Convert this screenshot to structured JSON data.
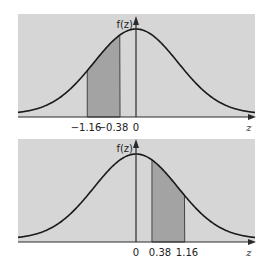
{
  "colors": {
    "background": "#ffffff",
    "panel_fill": "#d6d6d6",
    "shade_fill": "#a3a3a3",
    "curve": "#1a1a1a",
    "axis": "#2a2a2a"
  },
  "chart_data": [
    {
      "type": "area",
      "title": "",
      "ylabel": "f(z)",
      "xlabel": "z",
      "distribution": "standard normal",
      "shaded_interval": [
        -1.16,
        -0.38
      ],
      "tick_labels": [
        "-1.16",
        "-0.38",
        "0"
      ],
      "tick_values": [
        -1.16,
        -0.38,
        0
      ],
      "xlim": [
        -3.2,
        2.8
      ],
      "grid": false
    },
    {
      "type": "area",
      "title": "",
      "ylabel": "f(z)",
      "xlabel": "z",
      "distribution": "standard normal",
      "shaded_interval": [
        0.38,
        1.16
      ],
      "tick_labels": [
        "0",
        "0.38",
        "1.16"
      ],
      "tick_values": [
        0,
        0.38,
        1.16
      ],
      "xlim": [
        -3.2,
        2.8
      ],
      "grid": false
    }
  ],
  "top": {
    "ylabel": "f(z)",
    "xlabel": "z",
    "ticks": [
      "−1.16",
      "−0.38",
      "0"
    ]
  },
  "bottom": {
    "ylabel": "f(z)",
    "xlabel": "z",
    "ticks": [
      "0",
      "0.38",
      "1.16"
    ]
  }
}
